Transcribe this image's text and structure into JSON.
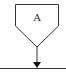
{
  "diagram": {
    "node": {
      "label": "A",
      "shape": "pentagon-down"
    },
    "connector": {
      "direction": "down",
      "arrow": "filled-triangle"
    },
    "baseline": {
      "type": "horizontal-line"
    },
    "colors": {
      "stroke": "#333333",
      "background": "#ffffff"
    }
  }
}
